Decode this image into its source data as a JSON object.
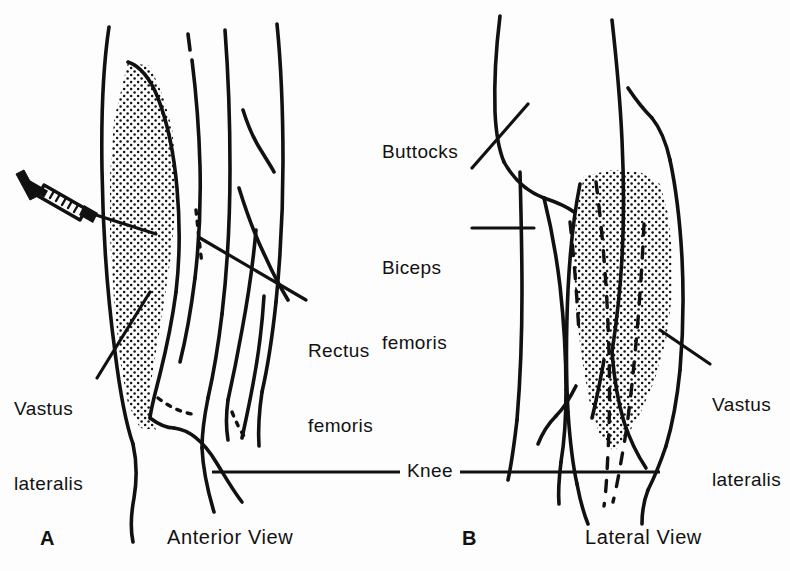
{
  "figure": {
    "background_color": "#fdfdfd",
    "ink_color": "#111111"
  },
  "panels": [
    {
      "letter": "A",
      "caption": "Anterior View",
      "labels": [
        {
          "id": "vastus-lateralis-a",
          "line1": "Vastus",
          "line2": "lateralis"
        },
        {
          "id": "rectus-femoris",
          "line1": "Rectus",
          "line2": "femoris"
        }
      ],
      "instrument": "syringe"
    },
    {
      "letter": "B",
      "caption": "Lateral View",
      "labels": [
        {
          "id": "buttocks",
          "line1": "Buttocks",
          "line2": ""
        },
        {
          "id": "biceps-femoris",
          "line1": "Biceps",
          "line2": "femoris"
        },
        {
          "id": "vastus-lateralis-b",
          "line1": "Vastus",
          "line2": "lateralis"
        }
      ],
      "instrument": ""
    }
  ],
  "shared_labels": {
    "knee": "Knee"
  },
  "label_text": {
    "vastus_a_line1": "Vastus",
    "vastus_a_line2": "lateralis",
    "rectus_line1": "Rectus",
    "rectus_line2": "femoris",
    "buttocks": "Buttocks",
    "biceps_line1": "Biceps",
    "biceps_line2": "femoris",
    "vastus_b_line1": "Vastus",
    "vastus_b_line2": "lateralis",
    "knee": "Knee",
    "letter_a": "A",
    "letter_b": "B",
    "caption_a": "Anterior View",
    "caption_b": "Lateral View"
  }
}
